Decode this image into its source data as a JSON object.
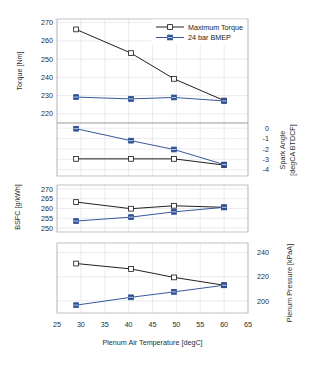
{
  "figure": {
    "kind": "multi-panel-line-chart",
    "panel_count": 4,
    "xlabel": "Plenum Air Temperature [degC]",
    "colors": {
      "maximum_torque": "#151515",
      "bmep_24bar": "#2c4f96",
      "grid": "#d8d8e2",
      "frame": "#9a9a9a"
    }
  },
  "legend": {
    "position": "top-right-panel-1",
    "entries": [
      {
        "label": "Maximum Torque",
        "color": "#151515",
        "marker": "open-square"
      },
      {
        "label": "24 bar BMEP",
        "color": "#2c4f96",
        "marker": "filled-square"
      }
    ]
  },
  "xaxis": {
    "label": "Plenum Air Temperature [degC]",
    "ticks": [
      25,
      30,
      35,
      40,
      45,
      50,
      55,
      60,
      65
    ],
    "min": 25,
    "max": 65
  },
  "chart_data": [
    {
      "type": "line",
      "panel": 1,
      "title": "",
      "xlabel": "Plenum Air Temperature [degC]",
      "ylabel": "Torque [Nm]",
      "ylim": [
        215,
        272
      ],
      "yticks": [
        220,
        230,
        240,
        250,
        260,
        270
      ],
      "grid": true,
      "legend": "top-right",
      "x": [
        29,
        40.5,
        49.5,
        60
      ],
      "series": [
        {
          "name": "Maximum Torque",
          "color": "#151515",
          "marker": "open-square",
          "values": [
            266.3,
            253.3,
            239.2,
            227.3
          ]
        },
        {
          "name": "24 bar BMEP",
          "color": "#2c4f96",
          "marker": "filled-square",
          "values": [
            229.2,
            228.2,
            229.0,
            227.1
          ]
        }
      ]
    },
    {
      "type": "line",
      "panel": 2,
      "title": "",
      "xlabel": "Plenum Air Temperature [degC]",
      "ylabel": "Spark Angle [degCA BTDCF]",
      "ylabel_side": "right",
      "ylim": [
        -4.6,
        0.5
      ],
      "yticks": [
        0,
        -1,
        -2,
        -3,
        -4
      ],
      "grid": true,
      "x": [
        29,
        40.5,
        49.5,
        60
      ],
      "series": [
        {
          "name": "Maximum Torque",
          "color": "#151515",
          "marker": "open-square",
          "values": [
            -2.95,
            -2.95,
            -2.95,
            -3.55
          ]
        },
        {
          "name": "24 bar BMEP",
          "color": "#2c4f96",
          "marker": "filled-square",
          "values": [
            -0.05,
            -1.2,
            -2.05,
            -3.5
          ]
        }
      ]
    },
    {
      "type": "line",
      "panel": 3,
      "title": "",
      "xlabel": "Plenum Air Temperature [degC]",
      "ylabel": "BSFC [g/kWh]",
      "ylim": [
        248,
        272
      ],
      "yticks": [
        250,
        255,
        260,
        265,
        270
      ],
      "grid": true,
      "x": [
        29,
        40.5,
        49.5,
        60
      ],
      "series": [
        {
          "name": "Maximum Torque",
          "color": "#151515",
          "marker": "open-square",
          "values": [
            263.3,
            259.9,
            261.4,
            260.6
          ]
        },
        {
          "name": "24 bar BMEP",
          "color": "#2c4f96",
          "marker": "filled-square",
          "values": [
            253.6,
            255.6,
            258.3,
            260.6
          ]
        }
      ]
    },
    {
      "type": "line",
      "panel": 4,
      "title": "",
      "xlabel": "Plenum Air Temperature [degC]",
      "ylabel": "Plenum Pressure [kPaA]",
      "ylabel_side": "right",
      "ylim": [
        190,
        248
      ],
      "yticks": [
        200,
        220,
        240
      ],
      "grid": true,
      "x": [
        29,
        40.5,
        49.5,
        60
      ],
      "series": [
        {
          "name": "Maximum Torque",
          "color": "#151515",
          "marker": "open-square",
          "values": [
            231.0,
            226.5,
            219.5,
            213.0
          ]
        },
        {
          "name": "24 bar BMEP",
          "color": "#2c4f96",
          "marker": "filled-square",
          "values": [
            196.5,
            203.0,
            207.5,
            213.0
          ]
        }
      ]
    }
  ],
  "labels": {
    "torque": "Torque [Nm]",
    "spark_angle_l1": "Spark Angle",
    "spark_angle_l2": "[degCA BTDCF]",
    "bsfc": "BSFC [g/kWh]",
    "plenum_pressure": "Plenum Pressure [kPaA]",
    "xaxis": "Plenum Air Temperature [degC]"
  },
  "ticktext": {
    "p1": [
      "270",
      "260",
      "250",
      "240",
      "230",
      "220"
    ],
    "p2": [
      "0",
      "-1",
      "-2",
      "-3",
      "-4"
    ],
    "p3": [
      "270",
      "265",
      "260",
      "255",
      "250"
    ],
    "p4": [
      "240",
      "220",
      "200"
    ],
    "x": [
      "25",
      "30",
      "35",
      "40",
      "45",
      "50",
      "55",
      "60",
      "65"
    ]
  }
}
